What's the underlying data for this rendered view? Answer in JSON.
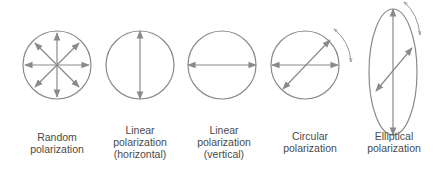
{
  "diagram": {
    "colors": {
      "stroke": "#8a8a8a",
      "text": "#4a4a4a"
    },
    "panels": [
      {
        "id": "random",
        "icon": "random-polarization-icon",
        "label_lines": [
          "Random",
          "polarization"
        ]
      },
      {
        "id": "linear-horizontal",
        "icon": "linear-polarization-horizontal-icon",
        "label_lines": [
          "Linear",
          "polarization",
          "(horizontal)"
        ]
      },
      {
        "id": "linear-vertical",
        "icon": "linear-polarization-vertical-icon",
        "label_lines": [
          "Linear",
          "polarization",
          "(vertical)"
        ]
      },
      {
        "id": "circular",
        "icon": "circular-polarization-icon",
        "label_lines": [
          "Circular",
          "polarization"
        ]
      },
      {
        "id": "elliptical",
        "icon": "elliptical-polarization-icon",
        "label_lines": [
          "Elliptical",
          "polarization"
        ]
      }
    ]
  }
}
